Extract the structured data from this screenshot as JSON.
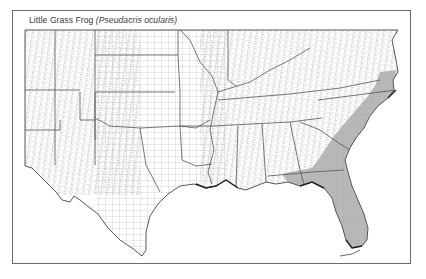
{
  "map": {
    "title_common": "Little Grass Frog",
    "title_scientific": "(Pseudacris ocularis)",
    "region": "Southeastern United States (county-level map)",
    "legend": "Shaded counties indicate species range",
    "colors": {
      "frame": "#6a6a6a",
      "county_lines": "#9a9a9a",
      "state_lines": "#555555",
      "range_fill": "#b8b8b8",
      "background": "#ffffff"
    },
    "range_states": [
      "Virginia",
      "North Carolina",
      "South Carolina",
      "Georgia",
      "Alabama",
      "Florida"
    ]
  }
}
